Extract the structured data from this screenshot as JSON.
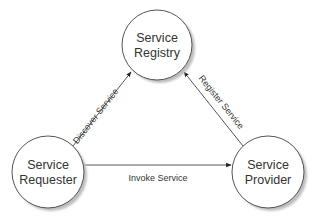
{
  "diagram": {
    "type": "service-oriented-architecture-triangle",
    "nodes": [
      {
        "id": "registry",
        "line1": "Service",
        "line2": "Registry"
      },
      {
        "id": "requester",
        "line1": "Service",
        "line2": "Requester"
      },
      {
        "id": "provider",
        "line1": "Service",
        "line2": "Provider"
      }
    ],
    "edges": [
      {
        "from": "requester",
        "to": "registry",
        "label": "Discover Service"
      },
      {
        "from": "provider",
        "to": "registry",
        "label": "Register Service"
      },
      {
        "from": "requester",
        "to": "provider",
        "label": "Invoke Service"
      }
    ],
    "colors": {
      "stroke": "#555555",
      "shadow": "#b8b8b8",
      "fill": "#ffffff",
      "text": "#333333"
    }
  }
}
